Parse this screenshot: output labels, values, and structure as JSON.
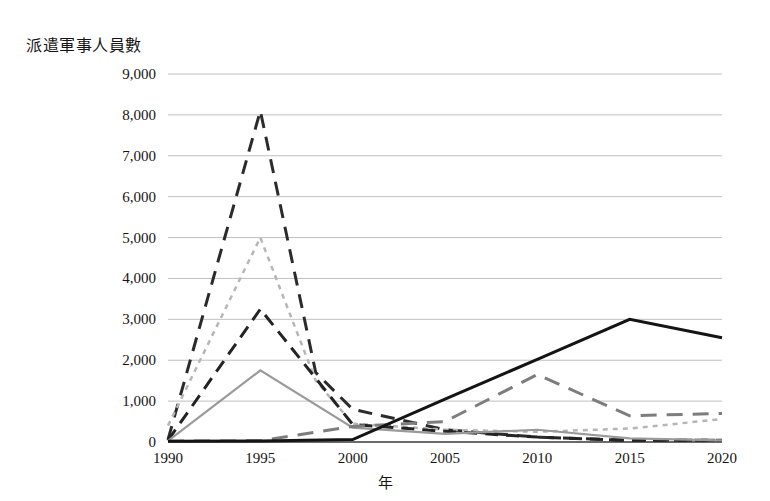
{
  "chart_data": {
    "type": "line",
    "title": "",
    "xlabel": "年",
    "ylabel": "派遣軍事人員數",
    "x": [
      1990,
      1995,
      1998,
      2000,
      2005,
      2010,
      2015,
      2020
    ],
    "categories": [
      "1990",
      "1995",
      "2000",
      "2005",
      "2010",
      "2015",
      "2020"
    ],
    "xlim": [
      1990,
      2020
    ],
    "ylim": [
      0,
      9000
    ],
    "ytick_labels": [
      "0",
      "1,000",
      "2,000",
      "3,000",
      "4,000",
      "5,000",
      "6,000",
      "7,000",
      "8,000",
      "9,000"
    ],
    "ytick_values": [
      0,
      1000,
      2000,
      3000,
      4000,
      5000,
      6000,
      7000,
      8000,
      9000
    ],
    "grid": true,
    "legend": "none",
    "series": [
      {
        "name": "series-dark-dashed-peak",
        "style": "dashed",
        "color": "#2b2b2b",
        "width": 3,
        "dash": "14,9",
        "points": [
          {
            "x": 1990,
            "y": 60
          },
          {
            "x": 1995,
            "y": 8100
          },
          {
            "x": 1998,
            "y": 1700
          },
          {
            "x": 2000,
            "y": 800
          },
          {
            "x": 2005,
            "y": 300
          },
          {
            "x": 2010,
            "y": 120
          },
          {
            "x": 2015,
            "y": 40
          },
          {
            "x": 2020,
            "y": 40
          }
        ]
      },
      {
        "name": "series-light-dotted",
        "style": "dotted",
        "color": "#b6b6b6",
        "width": 2.5,
        "dash": "5,5",
        "points": [
          {
            "x": 1990,
            "y": 400
          },
          {
            "x": 1995,
            "y": 5000
          },
          {
            "x": 1998,
            "y": 1500
          },
          {
            "x": 2000,
            "y": 450
          },
          {
            "x": 2005,
            "y": 300
          },
          {
            "x": 2010,
            "y": 250
          },
          {
            "x": 2015,
            "y": 330
          },
          {
            "x": 2020,
            "y": 560
          }
        ]
      },
      {
        "name": "series-dark-dashed-mid",
        "style": "dashed",
        "color": "#232323",
        "width": 3,
        "dash": "13,8",
        "points": [
          {
            "x": 1990,
            "y": 40
          },
          {
            "x": 1995,
            "y": 3250
          },
          {
            "x": 2000,
            "y": 430
          },
          {
            "x": 2005,
            "y": 260
          },
          {
            "x": 2010,
            "y": 120
          },
          {
            "x": 2015,
            "y": 40
          },
          {
            "x": 2020,
            "y": 40
          }
        ]
      },
      {
        "name": "series-gray-solid",
        "style": "solid",
        "color": "#9a9a9a",
        "width": 2.2,
        "dash": "",
        "points": [
          {
            "x": 1990,
            "y": 30
          },
          {
            "x": 1995,
            "y": 1750
          },
          {
            "x": 2000,
            "y": 350
          },
          {
            "x": 2005,
            "y": 200
          },
          {
            "x": 2010,
            "y": 300
          },
          {
            "x": 2015,
            "y": 90
          },
          {
            "x": 2020,
            "y": 40
          }
        ]
      },
      {
        "name": "series-gray-dashed-late",
        "style": "dashed",
        "color": "#7d7d7d",
        "width": 3,
        "dash": "16,10",
        "points": [
          {
            "x": 1990,
            "y": 20
          },
          {
            "x": 1995,
            "y": 30
          },
          {
            "x": 2000,
            "y": 380
          },
          {
            "x": 2005,
            "y": 500
          },
          {
            "x": 2010,
            "y": 1650
          },
          {
            "x": 2015,
            "y": 640
          },
          {
            "x": 2020,
            "y": 700
          }
        ]
      },
      {
        "name": "series-black-solid",
        "style": "solid",
        "color": "#141414",
        "width": 3,
        "dash": "",
        "points": [
          {
            "x": 1990,
            "y": 20
          },
          {
            "x": 1995,
            "y": 25
          },
          {
            "x": 2000,
            "y": 60
          },
          {
            "x": 2005,
            "y": 1050
          },
          {
            "x": 2010,
            "y": 2020
          },
          {
            "x": 2015,
            "y": 3000
          },
          {
            "x": 2020,
            "y": 2550
          }
        ]
      }
    ]
  },
  "plot_geometry": {
    "left": 168,
    "right": 722,
    "top": 74,
    "bottom": 442
  },
  "colors": {
    "gridline": "#b9b9b9",
    "baseline": "#3a3a3a",
    "text": "#141414"
  }
}
